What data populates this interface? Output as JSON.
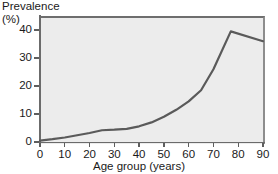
{
  "chart_data": {
    "type": "line",
    "title": "",
    "ylabel": "Prevalence",
    "yunit": "(%)",
    "xlabel": "Age group (years)",
    "xlim": [
      0,
      90
    ],
    "ylim": [
      0,
      45
    ],
    "xticks": [
      0,
      10,
      20,
      30,
      40,
      50,
      60,
      70,
      80,
      90
    ],
    "xtick_labels": [
      "0",
      "10",
      "20",
      "30",
      "40",
      "50",
      "60",
      "70",
      "80",
      "90"
    ],
    "yticks": [
      0,
      10,
      20,
      30,
      40
    ],
    "ytick_labels": [
      "0",
      "10",
      "20",
      "30",
      "40"
    ],
    "grid": false,
    "legend": false,
    "series": [
      {
        "name": "Prevalence",
        "color": "#5a5a5a",
        "x": [
          0,
          5,
          10,
          15,
          20,
          25,
          30,
          35,
          40,
          45,
          50,
          55,
          60,
          65,
          70,
          77,
          90
        ],
        "values": [
          0.5,
          1.0,
          1.6,
          2.4,
          3.2,
          4.2,
          4.4,
          4.7,
          5.6,
          7.0,
          9.0,
          11.5,
          14.5,
          18.5,
          26.0,
          39.5,
          36.0
        ]
      }
    ],
    "colors": {
      "plot_background": "#ececec",
      "axis": "#6b6b6b",
      "line": "#5a5a5a",
      "text": "#1a1a1a",
      "page_background": "#ffffff"
    }
  }
}
